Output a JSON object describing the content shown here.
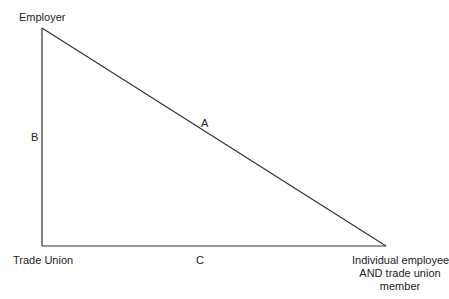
{
  "diagram": {
    "type": "triangle",
    "line_color": "#333333",
    "vertices": {
      "employer": {
        "label": "Employer",
        "x": 42,
        "y": 28
      },
      "trade_union": {
        "label": "Trade Union",
        "x": 42,
        "y": 246
      },
      "individual": {
        "label_lines": [
          "Individual employee",
          "AND trade union",
          "member"
        ],
        "x": 386,
        "y": 246
      }
    },
    "edges": {
      "a": {
        "label": "A",
        "from": "employer",
        "to": "individual"
      },
      "b": {
        "label": "B",
        "from": "employer",
        "to": "trade_union"
      },
      "c": {
        "label": "C",
        "from": "trade_union",
        "to": "individual"
      }
    }
  }
}
